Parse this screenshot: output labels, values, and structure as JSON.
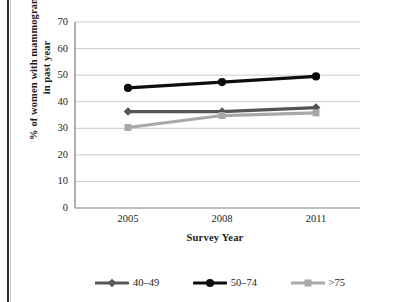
{
  "chart_data": {
    "type": "line",
    "title": "",
    "xlabel": "Survey Year",
    "ylabel": "% of women with mammogram in past year",
    "ylabel_line1": "% of women with mammogram",
    "ylabel_line2": "in past year",
    "categories": [
      "2005",
      "2008",
      "2011"
    ],
    "x": [
      2005,
      2008,
      2011
    ],
    "ylim": [
      0,
      70
    ],
    "yticks": [
      "0",
      "10",
      "20",
      "30",
      "40",
      "50",
      "60",
      "70"
    ],
    "ytick_values": [
      0,
      10,
      20,
      30,
      40,
      50,
      60,
      70
    ],
    "grid": true,
    "legend_position": "bottom",
    "series": [
      {
        "name": "40–49",
        "values": [
          36.3,
          36.3,
          37.8
        ],
        "color": "#555555",
        "marker": "diamond"
      },
      {
        "name": "50–74",
        "values": [
          45.2,
          47.4,
          49.5
        ],
        "color": "#0d0d0d",
        "marker": "circle"
      },
      {
        "name": ">75",
        "values": [
          30.3,
          34.8,
          35.8
        ],
        "color": "#a8a8a8",
        "marker": "square"
      }
    ]
  },
  "axes": {
    "y_ticks": [
      {
        "label": "70"
      },
      {
        "label": "60"
      },
      {
        "label": "50"
      },
      {
        "label": "40"
      },
      {
        "label": "30"
      },
      {
        "label": "20"
      },
      {
        "label": "10"
      },
      {
        "label": "0"
      }
    ],
    "x_ticks": [
      {
        "label": "2005"
      },
      {
        "label": "2008"
      },
      {
        "label": "2011"
      }
    ],
    "x_title": "Survey Year",
    "y_title_line1": "% of women with mammogram",
    "y_title_line2": "in past year"
  },
  "legend": {
    "items": [
      {
        "label": "40–49",
        "color": "#555555",
        "marker": "diamond"
      },
      {
        "label": "50–74",
        "color": "#0d0d0d",
        "marker": "circle"
      },
      {
        "label": ">75",
        "color": "#a8a8a8",
        "marker": "square"
      }
    ]
  },
  "colors": {
    "series_40_49": "#555555",
    "series_50_74": "#0d0d0d",
    "series_over_75": "#a8a8a8",
    "grid": "#c4c4c4",
    "axis": "#6e6e6e",
    "text": "#1a1a1a"
  }
}
